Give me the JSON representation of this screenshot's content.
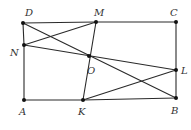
{
  "diagram": {
    "type": "geometry",
    "points": [
      {
        "id": "D",
        "label": "D",
        "x": 23,
        "y": 23,
        "lx": 25,
        "ly": 16
      },
      {
        "id": "M",
        "label": "M",
        "x": 96,
        "y": 22,
        "lx": 94,
        "ly": 16
      },
      {
        "id": "C",
        "label": "C",
        "x": 176,
        "y": 22,
        "lx": 170,
        "ly": 16
      },
      {
        "id": "N",
        "label": "N",
        "x": 24,
        "y": 45,
        "lx": 10,
        "ly": 56
      },
      {
        "id": "O",
        "label": "O",
        "x": 89,
        "y": 56,
        "lx": 87,
        "ly": 74
      },
      {
        "id": "L",
        "label": "L",
        "x": 176,
        "y": 70,
        "lx": 181,
        "ly": 74
      },
      {
        "id": "A",
        "label": "A",
        "x": 24,
        "y": 100,
        "lx": 19,
        "ly": 115
      },
      {
        "id": "K",
        "label": "K",
        "x": 83,
        "y": 100,
        "lx": 78,
        "ly": 115
      },
      {
        "id": "B",
        "label": "B",
        "x": 176,
        "y": 98,
        "lx": 171,
        "ly": 114
      }
    ],
    "segments": [
      [
        "D",
        "M"
      ],
      [
        "M",
        "C"
      ],
      [
        "C",
        "L"
      ],
      [
        "L",
        "B"
      ],
      [
        "A",
        "K"
      ],
      [
        "K",
        "B"
      ],
      [
        "D",
        "N"
      ],
      [
        "N",
        "A"
      ],
      [
        "D",
        "B"
      ],
      [
        "N",
        "M"
      ],
      [
        "N",
        "L"
      ],
      [
        "M",
        "K"
      ],
      [
        "K",
        "L"
      ]
    ],
    "colors": {
      "line": "#2a2a2a",
      "point": "#111111",
      "label": "#333333",
      "background": "#ffffff"
    }
  }
}
